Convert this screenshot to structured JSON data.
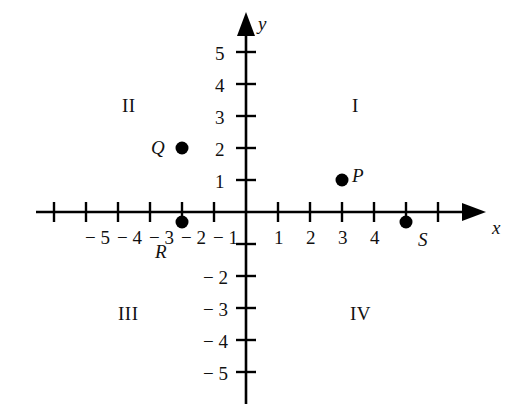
{
  "figure": {
    "type": "coordinate-plane",
    "background_color": "#ffffff",
    "ink_color": "#000000",
    "width": 519,
    "height": 417
  },
  "chart_data": {
    "type": "scatter",
    "title": "",
    "xlabel": "x",
    "ylabel": "y",
    "grid": false,
    "legend": "none",
    "xlim": [
      -6.6,
      6.6
    ],
    "ylim": [
      -5.9,
      6.2
    ],
    "x_axis": {
      "label": "x",
      "tick_values": [
        -6,
        -5,
        -4,
        -3,
        -2,
        -1,
        1,
        2,
        3,
        4,
        5,
        6
      ],
      "visible_tick_labels": [
        "− 5",
        "− 4",
        "− 3",
        "− 2",
        "− 1",
        "1",
        "2",
        "3",
        "4"
      ],
      "hidden_tick_labels": [
        "5"
      ],
      "hidden_reason": "covered-by-point-S-marker",
      "arrow": "right"
    },
    "y_axis": {
      "label": "y",
      "tick_values": [
        -5,
        -4,
        -3,
        -2,
        -1,
        1,
        2,
        3,
        4,
        5
      ],
      "visible_tick_labels": [
        "5",
        "4",
        "3",
        "2",
        "1",
        "− 2",
        "− 3",
        "− 4",
        "− 5"
      ],
      "arrow": "up"
    },
    "points": [
      {
        "name": "P",
        "label": "P",
        "x": 3,
        "y": 1,
        "label_side": "right"
      },
      {
        "name": "Q",
        "label": "Q",
        "x": -2,
        "y": 2,
        "label_side": "left"
      },
      {
        "name": "R",
        "label": "R",
        "x": -2,
        "y": 0,
        "label_side": "below"
      },
      {
        "name": "S",
        "label": "S",
        "x": 5,
        "y": 0,
        "label_side": "below-right"
      }
    ],
    "quadrant_labels": [
      {
        "name": "I",
        "label": "I",
        "x": 3.4,
        "y": 3.2
      },
      {
        "name": "II",
        "label": "II",
        "x": -3.9,
        "y": 3.2
      },
      {
        "name": "III",
        "label": "III",
        "x": -4.0,
        "y": -3.2
      },
      {
        "name": "IV",
        "label": "IV",
        "x": 3.2,
        "y": -3.2
      }
    ]
  },
  "x_tick_labels": [
    {
      "text": "− 5",
      "px": 85,
      "py": 228
    },
    {
      "text": "− 4",
      "px": 117,
      "py": 228
    },
    {
      "text": "− 3",
      "px": 149,
      "py": 228
    },
    {
      "text": "− 2",
      "px": 181,
      "py": 228
    },
    {
      "text": "− 1",
      "px": 213,
      "py": 228
    },
    {
      "text": "1",
      "px": 274,
      "py": 228
    },
    {
      "text": "2",
      "px": 306,
      "py": 228
    },
    {
      "text": "3",
      "px": 338,
      "py": 228
    },
    {
      "text": "4",
      "px": 370,
      "py": 228
    }
  ],
  "y_tick_labels": [
    {
      "text": "5",
      "px": 215,
      "py": 44
    },
    {
      "text": "4",
      "px": 215,
      "py": 76
    },
    {
      "text": "3",
      "px": 215,
      "py": 108
    },
    {
      "text": "2",
      "px": 215,
      "py": 140
    },
    {
      "text": "1",
      "px": 215,
      "py": 172
    },
    {
      "text": "− 2",
      "px": 203,
      "py": 268
    },
    {
      "text": "− 3",
      "px": 203,
      "py": 300
    },
    {
      "text": "− 4",
      "px": 203,
      "py": 332
    },
    {
      "text": "− 5",
      "px": 203,
      "py": 364
    }
  ],
  "axis_names": {
    "x": "x",
    "y": "y"
  },
  "quadrants": [
    {
      "text": "II",
      "px": 122,
      "py": 96
    },
    {
      "text": "I",
      "px": 352,
      "py": 96
    },
    {
      "text": "III",
      "px": 118,
      "py": 304
    },
    {
      "text": "IV",
      "px": 350,
      "py": 304
    }
  ],
  "point_labels": [
    {
      "text": "Q",
      "px": 151,
      "py": 138
    },
    {
      "text": "P",
      "px": 352,
      "py": 166
    },
    {
      "text": "R",
      "px": 155,
      "py": 242
    },
    {
      "text": "S",
      "px": 418,
      "py": 230
    }
  ]
}
